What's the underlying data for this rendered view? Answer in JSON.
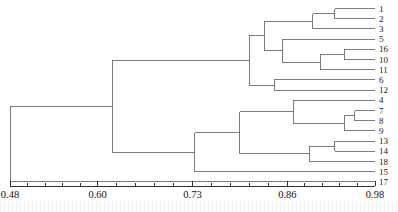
{
  "figure": {
    "kind": "dendrogram",
    "background_color": "#ffffff",
    "line_color": "#6e6e6e",
    "axis_color": "#1a1a1a",
    "label_color": "#1a1a1a"
  },
  "chart_data": {
    "type": "line",
    "chart_subtype": "dendrogram",
    "title": "",
    "xlabel": "",
    "ylabel": "",
    "grid": false,
    "legend": null,
    "orientation": "horizontal-right-leaves",
    "xlim": [
      0.48,
      0.98
    ],
    "xticks": [
      0.48,
      0.6,
      0.73,
      0.86,
      0.98
    ],
    "xtick_labels": [
      "0.48",
      "0.60",
      "0.73",
      "0.86",
      "0.98"
    ],
    "minor_ticks_per_interval": 4,
    "leaf_order": [
      "1",
      "2",
      "3",
      "5",
      "16",
      "10",
      "11",
      "6",
      "12",
      "4",
      "7",
      "8",
      "9",
      "13",
      "14",
      "18",
      "15",
      "17"
    ],
    "leaf_count": 18,
    "leaves": [
      {
        "label": "1",
        "row": 0
      },
      {
        "label": "2",
        "row": 1
      },
      {
        "label": "3",
        "row": 2
      },
      {
        "label": "5",
        "row": 3
      },
      {
        "label": "16",
        "row": 4
      },
      {
        "label": "10",
        "row": 5
      },
      {
        "label": "11",
        "row": 6
      },
      {
        "label": "6",
        "row": 7
      },
      {
        "label": "12",
        "row": 8
      },
      {
        "label": "4",
        "row": 9
      },
      {
        "label": "7",
        "row": 10
      },
      {
        "label": "8",
        "row": 11
      },
      {
        "label": "9",
        "row": 12
      },
      {
        "label": "13",
        "row": 13
      },
      {
        "label": "14",
        "row": 14
      },
      {
        "label": "18",
        "row": 15
      },
      {
        "label": "15",
        "row": 16
      },
      {
        "label": "17",
        "row": 17
      }
    ],
    "merges": [
      {
        "id": "m1",
        "children": [
          "1",
          "2"
        ],
        "x": 0.925
      },
      {
        "id": "m2",
        "children": [
          "m1",
          "3"
        ],
        "x": 0.895
      },
      {
        "id": "m3",
        "children": [
          "16",
          "10"
        ],
        "x": 0.938
      },
      {
        "id": "m4",
        "children": [
          "m3",
          "11"
        ],
        "x": 0.905
      },
      {
        "id": "m5",
        "children": [
          "5",
          "m4"
        ],
        "x": 0.853
      },
      {
        "id": "m6",
        "children": [
          "m2",
          "m5"
        ],
        "x": 0.828
      },
      {
        "id": "m7",
        "children": [
          "6",
          "12"
        ],
        "x": 0.842
      },
      {
        "id": "m8",
        "children": [
          "m6",
          "m7"
        ],
        "x": 0.808
      },
      {
        "id": "m9",
        "children": [
          "7",
          "8"
        ],
        "x": 0.952
      },
      {
        "id": "m10",
        "children": [
          "m9",
          "9"
        ],
        "x": 0.938
      },
      {
        "id": "m11",
        "children": [
          "4",
          "m10"
        ],
        "x": 0.868
      },
      {
        "id": "m12",
        "children": [
          "13",
          "14"
        ],
        "x": 0.925
      },
      {
        "id": "m13",
        "children": [
          "m12",
          "18"
        ],
        "x": 0.89
      },
      {
        "id": "m14",
        "children": [
          "m11",
          "m13"
        ],
        "x": 0.795
      },
      {
        "id": "m15",
        "children": [
          "m14",
          "15"
        ],
        "x": 0.733
      },
      {
        "id": "m16",
        "children": [
          "m8",
          "m15"
        ],
        "x": 0.62
      },
      {
        "id": "m17",
        "children": [
          "m16",
          "17"
        ],
        "x": 0.48
      }
    ]
  }
}
